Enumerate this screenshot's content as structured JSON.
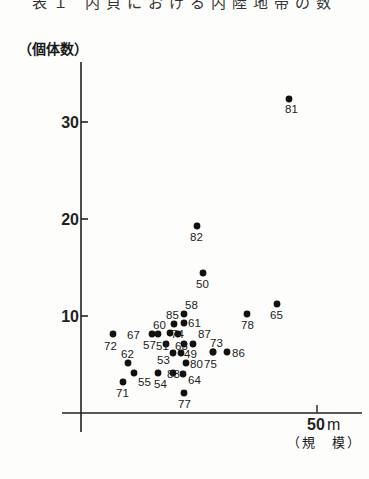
{
  "title": "表１ 内貝における内陸地帯の数",
  "y_axis_label": "（個体数）",
  "x_axis_label": "（規　模）",
  "x_tick_unit": "m",
  "chart_data": {
    "type": "scatter",
    "xlabel": "規模 (m)",
    "ylabel": "個体数",
    "x_ticks": [
      50
    ],
    "y_ticks": [
      10,
      20,
      30
    ],
    "xlim": [
      0,
      55
    ],
    "ylim": [
      0,
      35
    ],
    "grid": false,
    "points": [
      {
        "label": "81",
        "x": 44,
        "y": 32
      },
      {
        "label": "82",
        "x": 25,
        "y": 19
      },
      {
        "label": "50",
        "x": 26,
        "y": 14
      },
      {
        "label": "65",
        "x": 41,
        "y": 11
      },
      {
        "label": "78",
        "x": 35,
        "y": 10
      },
      {
        "label": "58",
        "x": 22,
        "y": 10
      },
      {
        "label": "85",
        "x": 20,
        "y": 9
      },
      {
        "label": "61",
        "x": 22,
        "y": 9
      },
      {
        "label": "60",
        "x": 17,
        "y": 8
      },
      {
        "label": "74",
        "x": 19,
        "y": 8
      },
      {
        "label": "67",
        "x": 12,
        "y": 8
      },
      {
        "label": "72",
        "x": 1,
        "y": 8
      },
      {
        "label": "57",
        "x": 14,
        "y": 7
      },
      {
        "label": "51",
        "x": 17,
        "y": 7
      },
      {
        "label": "63",
        "x": 21,
        "y": 7
      },
      {
        "label": "87",
        "x": 24,
        "y": 7
      },
      {
        "label": "73",
        "x": 27,
        "y": 6
      },
      {
        "label": "86",
        "x": 30,
        "y": 6
      },
      {
        "label": "75",
        "x": 28,
        "y": 6
      },
      {
        "label": "62",
        "x": 4,
        "y": 5
      },
      {
        "label": "53",
        "x": 18,
        "y": 5
      },
      {
        "label": "49",
        "x": 21,
        "y": 5
      },
      {
        "label": "80",
        "x": 22,
        "y": 5
      },
      {
        "label": "55",
        "x": 5,
        "y": 4
      },
      {
        "label": "54",
        "x": 16,
        "y": 4
      },
      {
        "label": "83",
        "x": 19,
        "y": 4
      },
      {
        "label": "64",
        "x": 22,
        "y": 4
      },
      {
        "label": "71",
        "x": 3,
        "y": 3
      },
      {
        "label": "77",
        "x": 22,
        "y": 2
      }
    ]
  },
  "plot": [
    {
      "label": "81",
      "px": 289,
      "py": 99,
      "lx": 285,
      "ly": 113
    },
    {
      "label": "82",
      "px": 197,
      "py": 226,
      "lx": 190,
      "ly": 241
    },
    {
      "label": "50",
      "px": 203,
      "py": 273,
      "lx": 196,
      "ly": 288
    },
    {
      "label": "65",
      "px": 277,
      "py": 304,
      "lx": 270,
      "ly": 319
    },
    {
      "label": "78",
      "px": 247,
      "py": 314,
      "lx": 241,
      "ly": 329
    },
    {
      "label": "58",
      "px": 184,
      "py": 314,
      "lx": 185,
      "ly": 309
    },
    {
      "label": "85",
      "px": 174,
      "py": 324,
      "lx": 166,
      "ly": 319
    },
    {
      "label": "61",
      "px": 184,
      "py": 323,
      "lx": 188,
      "ly": 327
    },
    {
      "label": "60",
      "px": 170,
      "py": 333,
      "lx": 153,
      "ly": 329
    },
    {
      "label": "74",
      "px": 178,
      "py": 334,
      "lx": 171,
      "ly": 338
    },
    {
      "label": "67",
      "px": 152,
      "py": 334,
      "lx": 127,
      "ly": 339
    },
    {
      "label": "72",
      "px": 113,
      "py": 334,
      "lx": 104,
      "ly": 350
    },
    {
      "label": "57",
      "px": 158,
      "py": 334,
      "lx": 143,
      "ly": 349
    },
    {
      "label": "51",
      "px": 166,
      "py": 344,
      "lx": 156,
      "ly": 350
    },
    {
      "label": "63",
      "px": 184,
      "py": 344,
      "lx": 175,
      "ly": 350
    },
    {
      "label": "87",
      "px": 193,
      "py": 344,
      "lx": 198,
      "ly": 338
    },
    {
      "label": "73",
      "px": 213,
      "py": 352,
      "lx": 210,
      "ly": 347
    },
    {
      "label": "86",
      "px": 227,
      "py": 352,
      "lx": 232,
      "ly": 357
    },
    {
      "label": "75",
      "px": 213,
      "py": 352,
      "lx": 204,
      "ly": 368
    },
    {
      "label": "62",
      "px": 128,
      "py": 363,
      "lx": 121,
      "ly": 358
    },
    {
      "label": "53",
      "px": 173,
      "py": 353,
      "lx": 157,
      "ly": 364
    },
    {
      "label": "49",
      "px": 181,
      "py": 353,
      "lx": 184,
      "ly": 358
    },
    {
      "label": "80",
      "px": 186,
      "py": 363,
      "lx": 190,
      "ly": 368
    },
    {
      "label": "55",
      "px": 134,
      "py": 373,
      "lx": 138,
      "ly": 386
    },
    {
      "label": "54",
      "px": 158,
      "py": 373,
      "lx": 154,
      "ly": 388
    },
    {
      "label": "83",
      "px": 173,
      "py": 373,
      "lx": 167,
      "ly": 378
    },
    {
      "label": "64",
      "px": 183,
      "py": 374,
      "lx": 188,
      "ly": 384
    },
    {
      "label": "71",
      "px": 123,
      "py": 382,
      "lx": 116,
      "ly": 397
    },
    {
      "label": "77",
      "px": 184,
      "py": 393,
      "lx": 178,
      "ly": 408
    }
  ]
}
